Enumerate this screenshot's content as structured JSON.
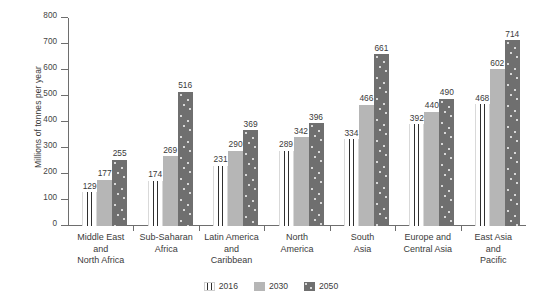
{
  "chart_data": {
    "type": "bar",
    "title": "",
    "xlabel": "",
    "ylabel": "Millions of tonnes per year",
    "ylim": [
      0,
      800
    ],
    "yticks": [
      0,
      100,
      200,
      300,
      400,
      500,
      600,
      700,
      800
    ],
    "ytick_labels": [
      "0",
      "100",
      "200",
      "300",
      "400",
      "500",
      "600",
      "700",
      "800"
    ],
    "grid": false,
    "legend_position": "bottom-center",
    "categories": [
      "Middle East\nand\nNorth Africa",
      "Sub-Saharan\nAfrica",
      "Latin America\nand\nCaribbean",
      "North\nAmerica",
      "South\nAsia",
      "Europe and\nCentral Asia",
      "East Asia\nand\nPacific"
    ],
    "series": [
      {
        "name": "2016",
        "color": "#ffffff",
        "pattern": "vertical-stripes",
        "values": [
          129,
          174,
          231,
          289,
          334,
          392,
          468
        ]
      },
      {
        "name": "2030",
        "color": "#b6b6b6",
        "pattern": "solid",
        "values": [
          177,
          269,
          290,
          342,
          466,
          440,
          602
        ]
      },
      {
        "name": "2050",
        "color": "#6f6f6f",
        "pattern": "dotted",
        "values": [
          255,
          516,
          369,
          396,
          661,
          490,
          714
        ]
      }
    ]
  },
  "legend": {
    "items": [
      {
        "label": "2016"
      },
      {
        "label": "2030"
      },
      {
        "label": "2050"
      }
    ]
  }
}
